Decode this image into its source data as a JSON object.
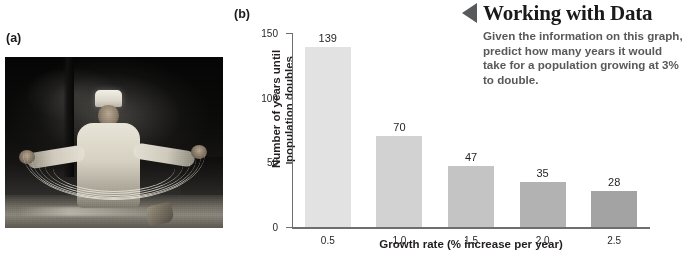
{
  "panels": {
    "photo_label": "(a)",
    "chart_label": "(b)"
  },
  "photo": {
    "alt": "chef-stretching-noodles-photograph"
  },
  "callout": {
    "triangle_icon": "left-triangle-icon",
    "title": "Working with Data",
    "body": "Given the information on this graph, predict how many years it would take for a population growing at 3% to double.",
    "title_color": "#1a1a1a",
    "body_color": "#58595b",
    "triangle_color": "#58595b"
  },
  "chart_data": {
    "type": "bar",
    "title": "",
    "categories": [
      "0.5",
      "1.0",
      "1.5",
      "2.0",
      "2.5"
    ],
    "values": [
      139,
      70,
      47,
      35,
      28
    ],
    "bar_colors": [
      "#e2e2e2",
      "#d2d2d2",
      "#c4c4c4",
      "#b2b2b2",
      "#a3a3a3"
    ],
    "xlabel": "Growth rate (% increase per year)",
    "ylabel": "Number of years until population doubles",
    "ylabel_lines": [
      "Number of years until",
      "population doubles"
    ],
    "ylim": [
      0,
      150
    ],
    "yticks": [
      0,
      50,
      100,
      150
    ],
    "ytick_labels": [
      "0",
      "50",
      "100",
      "150"
    ],
    "grid": false,
    "legend": false,
    "axis_color": "#6d6e71",
    "value_labels_shown": true
  }
}
